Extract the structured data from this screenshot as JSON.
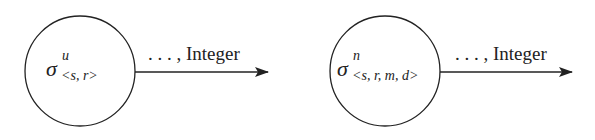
{
  "diagram": {
    "nodes": [
      {
        "id": "node-1",
        "symbol": "σ",
        "superscript": "u",
        "subscript": "<s, r>",
        "cx": 80,
        "cy": 71,
        "r": 55
      },
      {
        "id": "node-2",
        "symbol": "σ",
        "superscript": "n",
        "subscript": "<s, r, m, d>",
        "cx": 385,
        "cy": 71,
        "r": 55
      }
    ],
    "edges": [
      {
        "from": "node-1",
        "label": ". . . , Integer",
        "x1": 135,
        "x2": 268,
        "y": 72
      },
      {
        "from": "node-2",
        "label": ". . . , Integer",
        "x1": 440,
        "x2": 572,
        "y": 72
      }
    ],
    "colors": {
      "stroke": "#222222",
      "background": "#ffffff"
    }
  }
}
